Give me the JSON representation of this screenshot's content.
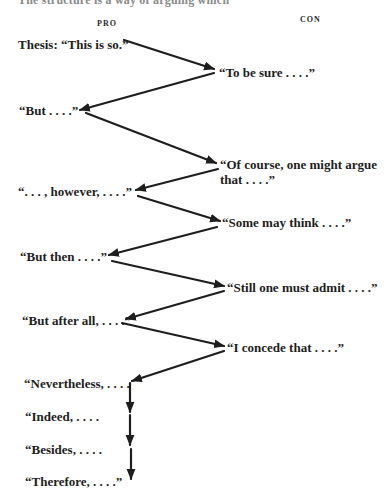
{
  "page": {
    "cut_heading": "The structure is a way of arguing which"
  },
  "columns": {
    "pro": "PRO",
    "con": "CON"
  },
  "nodes": [
    {
      "id": "thesis",
      "side": "pro",
      "text": "Thesis: “This is so.”"
    },
    {
      "id": "to-be-sure",
      "side": "con",
      "text": "“To be sure . . . .”"
    },
    {
      "id": "but",
      "side": "pro",
      "text": "“But . . . .”"
    },
    {
      "id": "of-course",
      "side": "con",
      "text": "“Of course, one might argue",
      "text2": "that . . . .”"
    },
    {
      "id": "however",
      "side": "pro",
      "text": "“. . . , however, . . . .”"
    },
    {
      "id": "some-may-think",
      "side": "con",
      "text": "“Some may think . . . .”"
    },
    {
      "id": "but-then",
      "side": "pro",
      "text": "“But then . . . .”"
    },
    {
      "id": "still-one-must-admit",
      "side": "con",
      "text": "“Still one must admit . . . .”"
    },
    {
      "id": "but-after-all",
      "side": "pro",
      "text": "“But after all, . . . .”"
    },
    {
      "id": "i-concede",
      "side": "con",
      "text": "“I concede that . . . .”"
    },
    {
      "id": "nevertheless",
      "side": "pro",
      "text": "“Nevertheless, . . . ."
    },
    {
      "id": "indeed",
      "side": "pro",
      "text": "“Indeed, . . . ."
    },
    {
      "id": "besides",
      "side": "pro",
      "text": "“Besides, . . . ."
    },
    {
      "id": "therefore",
      "side": "pro",
      "text": "“Therefore, . . . .”"
    }
  ],
  "edges": [
    {
      "from": "thesis",
      "to": "to-be-sure"
    },
    {
      "from": "to-be-sure",
      "to": "but"
    },
    {
      "from": "but",
      "to": "of-course"
    },
    {
      "from": "of-course",
      "to": "however"
    },
    {
      "from": "however",
      "to": "some-may-think"
    },
    {
      "from": "some-may-think",
      "to": "but-then"
    },
    {
      "from": "but-then",
      "to": "still-one-must-admit"
    },
    {
      "from": "still-one-must-admit",
      "to": "but-after-all"
    },
    {
      "from": "but-after-all",
      "to": "i-concede"
    },
    {
      "from": "i-concede",
      "to": "nevertheless"
    },
    {
      "from": "nevertheless",
      "to": "indeed"
    },
    {
      "from": "indeed",
      "to": "besides"
    },
    {
      "from": "besides",
      "to": "therefore"
    }
  ],
  "colors": {
    "ink": "#1e1e1e",
    "background": "#ffffff"
  }
}
